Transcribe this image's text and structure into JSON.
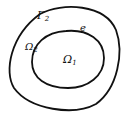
{
  "diagram": {
    "type": "nested-domains",
    "outer_boundary": {
      "label": "Γ",
      "subscript": "2"
    },
    "inner_boundary": {
      "label": "e"
    },
    "outer_region": {
      "label": "Ω",
      "subscript": "2"
    },
    "inner_region": {
      "label": "Ω",
      "subscript": "1"
    },
    "stroke_color": "#111111",
    "background": "#ffffff"
  }
}
